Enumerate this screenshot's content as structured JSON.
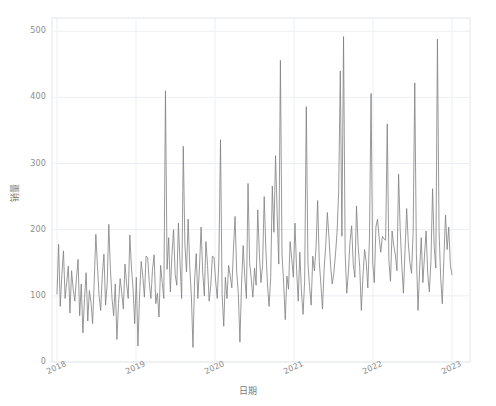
{
  "chart_data": {
    "type": "line",
    "title": "",
    "subtitle": "",
    "xlabel": "日期",
    "ylabel": "销量",
    "ylim": [
      0,
      520
    ],
    "yticks": [
      0,
      100,
      200,
      300,
      400,
      500
    ],
    "ytick_labels": [
      "0",
      "100",
      "200",
      "300",
      "400",
      "500"
    ],
    "xticks": [
      "2018",
      "2019",
      "2020",
      "2021",
      "2022",
      "2023"
    ],
    "xtick_rotation": -25,
    "grid": true,
    "grid_color": "#eceff3",
    "legend": null,
    "series": [
      {
        "name": "销量",
        "color": "#7f7f7f",
        "linewidth": 0.8,
        "x_start": "2018",
        "x_end": "2023",
        "sampling": "weekly",
        "values": [
          103,
          178,
          84,
          132,
          168,
          96,
          120,
          145,
          74,
          138,
          110,
          92,
          126,
          155,
          70,
          118,
          44,
          96,
          135,
          62,
          108,
          90,
          58,
          122,
          193,
          144,
          100,
          78,
          132,
          163,
          86,
          118,
          208,
          140,
          96,
          70,
          118,
          34,
          88,
          126,
          104,
          80,
          148,
          118,
          96,
          192,
          142,
          110,
          58,
          128,
          24,
          100,
          152,
          130,
          98,
          160,
          158,
          120,
          96,
          140,
          162,
          88,
          104,
          68,
          146,
          120,
          96,
          410,
          140,
          188,
          106,
          162,
          200,
          132,
          116,
          210,
          150,
          96,
          326,
          178,
          136,
          216,
          144,
          100,
          22,
          124,
          164,
          96,
          142,
          204,
          136,
          100,
          182,
          146,
          92,
          116,
          160,
          158,
          122,
          96,
          154,
          336,
          102,
          54,
          128,
          96,
          146,
          130,
          112,
          170,
          220,
          136,
          104,
          30,
          118,
          176,
          128,
          96,
          270,
          150,
          126,
          98,
          142,
          116,
          230,
          164,
          120,
          146,
          250,
          172,
          118,
          84,
          128,
          266,
          196,
          312,
          224,
          148,
          456,
          162,
          120,
          64,
          130,
          110,
          182,
          156,
          128,
          210,
          140,
          92,
          166,
          106,
          72,
          124,
          386,
          150,
          114,
          86,
          160,
          138,
          172,
          244,
          152,
          118,
          80,
          140,
          176,
          226,
          188,
          146,
          118,
          134,
          162,
          196,
          258,
          440,
          190,
          492,
          164,
          104,
          136,
          182,
          206,
          148,
          128,
          236,
          176,
          144,
          78,
          130,
          170,
          152,
          112,
          186,
          406,
          150,
          120,
          204,
          216,
          188,
          166,
          190,
          186,
          184,
          360,
          154,
          122,
          198,
          176,
          162,
          138,
          284,
          200,
          146,
          104,
          170,
          232,
          180,
          150,
          134,
          196,
          422,
          164,
          78,
          140,
          188,
          120,
          160,
          198,
          134,
          106,
          152,
          262,
          174,
          142,
          488,
          198,
          128,
          88,
          158,
          222,
          170,
          204,
          146,
          132
        ]
      }
    ]
  },
  "axes": {
    "ytick_positions_px": [
      358,
      294,
      229,
      164,
      99,
      34
    ],
    "xtick_positions_px": [
      57,
      136,
      215,
      294,
      373,
      452
    ],
    "plot_box_px": {
      "left": 52,
      "top": 18,
      "right": 470,
      "bottom": 362
    }
  }
}
